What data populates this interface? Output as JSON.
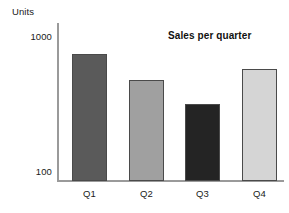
{
  "chart_data": {
    "type": "bar",
    "title": "Sales per quarter",
    "xlabel": "",
    "ylabel": "Units",
    "categories": [
      "Q1",
      "Q2",
      "Q3",
      "Q4"
    ],
    "values": [
      750,
      480,
      320,
      580
    ],
    "yscale": "log",
    "ylim": [
      100,
      1000
    ],
    "yticks": [
      "1000",
      "100"
    ],
    "ytick_values": [
      1000,
      100
    ],
    "grid": false,
    "legend": false,
    "bar_colors": [
      "#5a5a5a",
      "#a0a0a0",
      "#242424",
      "#d5d5d5"
    ],
    "bar_border_color": "#4a4a4a",
    "axis_color": "#9a9a9a",
    "background": "#ffffff",
    "text_color": "#1a1a1a",
    "series": [
      {
        "name": "Units",
        "values": [
          750,
          480,
          320,
          580
        ]
      }
    ],
    "bars": [
      {
        "category": "Q1",
        "value": 750,
        "color": "#5a5a5a"
      },
      {
        "category": "Q2",
        "value": 480,
        "color": "#a0a0a0"
      },
      {
        "category": "Q3",
        "value": 320,
        "color": "#242424"
      },
      {
        "category": "Q4",
        "value": 580,
        "color": "#d5d5d5"
      }
    ]
  }
}
